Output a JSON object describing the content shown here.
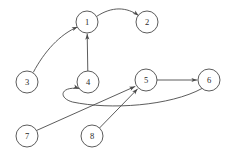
{
  "graph": {
    "title": "Directed Graph",
    "type": "directed-graph",
    "node_radius": 11,
    "stroke_color": "#4a4a4a",
    "label_color": "#2a2a2a",
    "background_color": "#ffffff",
    "nodes": [
      {
        "id": "1",
        "label": "1",
        "cx": 87,
        "cy": 22
      },
      {
        "id": "2",
        "label": "2",
        "cx": 147,
        "cy": 22
      },
      {
        "id": "3",
        "label": "3",
        "cx": 27,
        "cy": 82
      },
      {
        "id": "4",
        "label": "4",
        "cx": 88,
        "cy": 82
      },
      {
        "id": "5",
        "label": "5",
        "cx": 146,
        "cy": 80
      },
      {
        "id": "6",
        "label": "6",
        "cx": 209,
        "cy": 80
      },
      {
        "id": "7",
        "label": "7",
        "cx": 27,
        "cy": 136
      },
      {
        "id": "8",
        "label": "8",
        "cx": 92,
        "cy": 136
      }
    ],
    "edges": [
      {
        "id": "edge-3-1",
        "from": "3",
        "to": "1",
        "shape": "curve",
        "path": "M 33.5 72.0 C 44 52 60 34 77.5 27.0",
        "arrow_at": {
          "x": 77.5,
          "y": 27.0,
          "angle": 338
        }
      },
      {
        "id": "edge-1-2",
        "from": "1",
        "to": "2",
        "shape": "curve",
        "path": "M 96.5 16.5 C 112 6 127 7 138.5 15.5",
        "arrow_at": {
          "x": 138.5,
          "y": 15.5,
          "angle": 37
        }
      },
      {
        "id": "edge-4-1",
        "from": "4",
        "to": "1",
        "shape": "straight",
        "path": "M 87.8 71.0 L 87.2 34.0",
        "arrow_at": {
          "x": 87.2,
          "y": 34.0,
          "angle": 269
        }
      },
      {
        "id": "edge-5-6",
        "from": "5",
        "to": "6",
        "shape": "straight",
        "path": "M 157.0 80.0 L 197.0 80.0",
        "arrow_at": {
          "x": 197.0,
          "y": 80.0,
          "angle": 0
        }
      },
      {
        "id": "edge-6-4",
        "from": "6",
        "to": "4",
        "shape": "curve",
        "path": "M 202.0 88.5 C 170 106 110 110 72.5 102 C 58 98 60 86 79.0 88.5",
        "arrow_at": {
          "x": 79.0,
          "y": 88.5,
          "angle": 20
        }
      },
      {
        "id": "edge-7-5",
        "from": "7",
        "to": "5",
        "shape": "straight",
        "path": "M 36.5 130.5 L 135.0 86.5",
        "arrow_at": {
          "x": 135.0,
          "y": 86.5,
          "angle": 336
        }
      },
      {
        "id": "edge-8-5",
        "from": "8",
        "to": "5",
        "shape": "straight",
        "path": "M 99.5 128.0 L 137.5 89.0",
        "arrow_at": {
          "x": 137.5,
          "y": 89.0,
          "angle": 314
        }
      }
    ]
  }
}
